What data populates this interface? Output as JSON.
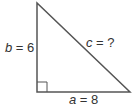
{
  "diagram": {
    "type": "right-triangle",
    "stroke_color": "#555555",
    "labels": {
      "b": {
        "var": "b",
        "eq": " = ",
        "val": "6"
      },
      "c": {
        "var": "c",
        "eq": " = ",
        "val": "?"
      },
      "a": {
        "var": "a",
        "eq": " = ",
        "val": "8"
      }
    },
    "right_angle_marker": true
  }
}
